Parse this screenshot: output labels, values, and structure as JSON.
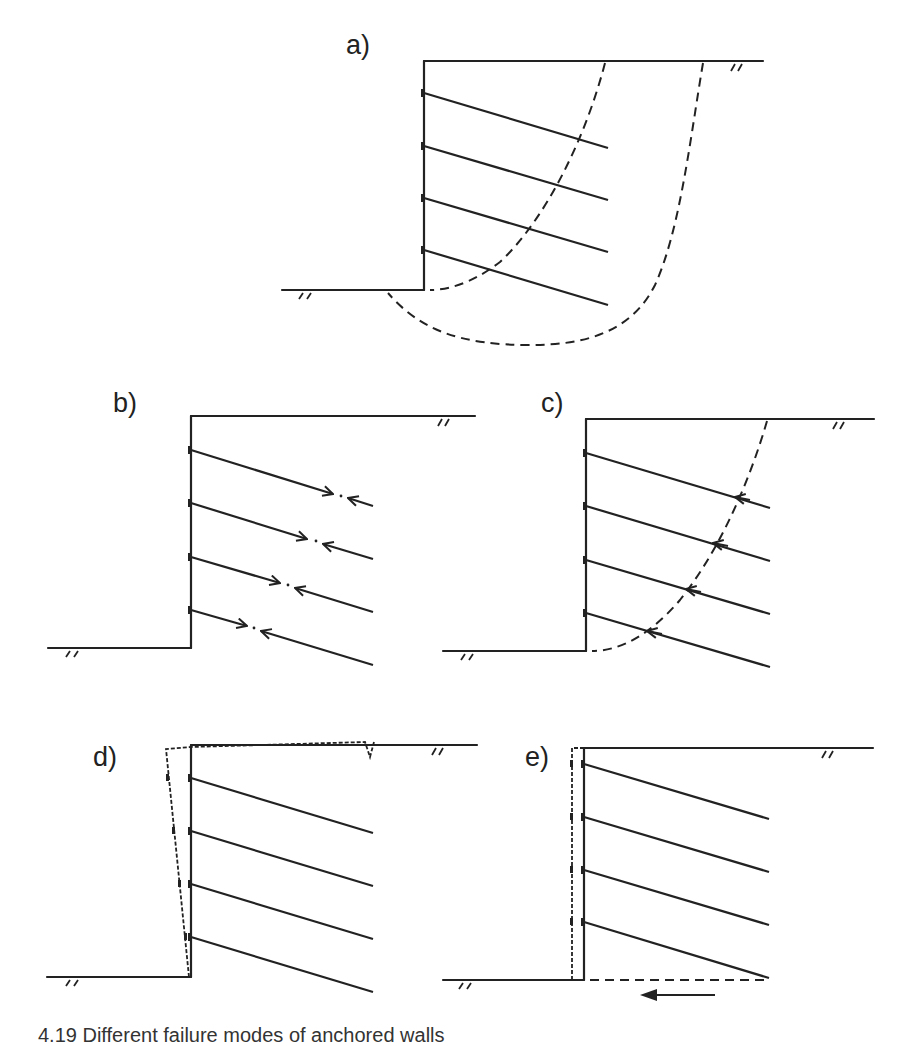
{
  "figure": {
    "panels": [
      {
        "id": "a",
        "label": "a)",
        "description": "Anchored wall with two potential deep-seated failure surfaces (dashed curves)"
      },
      {
        "id": "b",
        "label": "b)",
        "description": "Anchored wall with anchors pulling apart (tendon/grout failure, opposing arrows)"
      },
      {
        "id": "c",
        "label": "c)",
        "description": "Anchored wall with failure surface crossing anchors (pull-out, arrows at slip surface)"
      },
      {
        "id": "d",
        "label": "d)",
        "description": "Anchored wall rotating forward about toe (dashed displaced wall, ground crack at surface)"
      },
      {
        "id": "e",
        "label": "e)",
        "description": "Anchored wall sliding horizontally along base (dashed sliding plane, arrow showing direction)"
      }
    ],
    "caption": "4.19 Different failure modes of anchored walls",
    "colors": {
      "line": "#222222",
      "background": "#ffffff"
    }
  }
}
